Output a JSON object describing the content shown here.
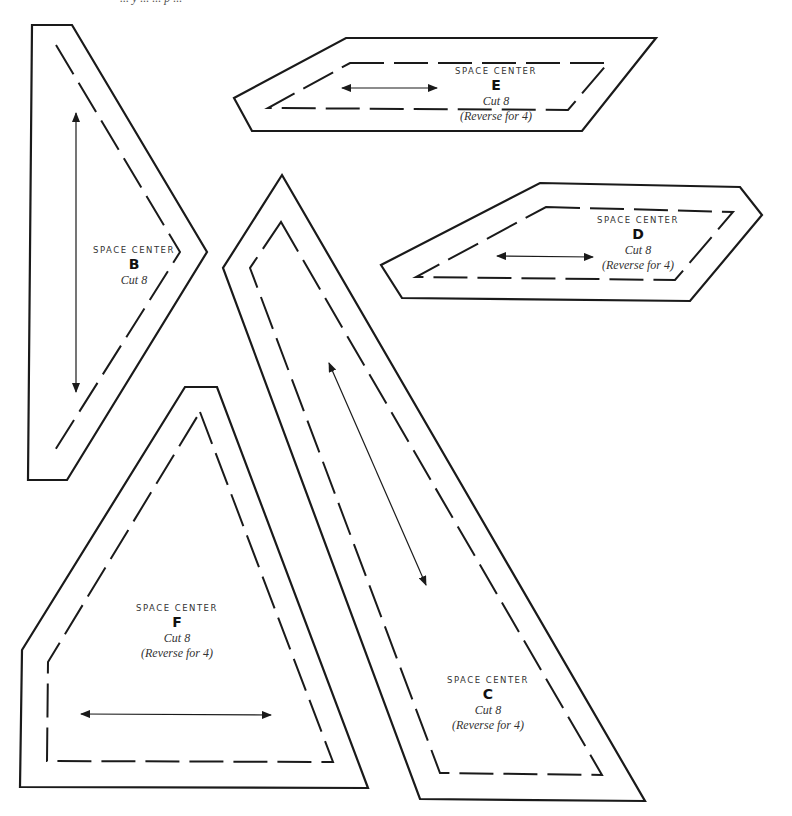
{
  "page": {
    "background": "#ffffff",
    "line_color": "#1a1a1a",
    "top_fragment": "... y ... ... p ..."
  },
  "pieces": {
    "B": {
      "block": "SPACE CENTER",
      "letter": "B",
      "cut": "Cut 8",
      "outline": "32,25 72,25 207,252 67,480 28,480",
      "seam": "56,45 180,252 52,455",
      "seam_closed": false,
      "grain": {
        "x1": 76,
        "y1": 113,
        "x2": 76,
        "y2": 392
      }
    },
    "E": {
      "block": "SPACE CENTER",
      "letter": "E",
      "cut": "Cut 8",
      "reverse": "(Reverse for 4)",
      "outline": "346,38 656,38 582,131 252,131 234,98",
      "seam": "350,63 608,63 568,110 268,108",
      "grain": {
        "x1": 342,
        "y1": 88,
        "x2": 437,
        "y2": 88
      }
    },
    "D": {
      "block": "SPACE CENTER",
      "letter": "D",
      "cut": "Cut 8",
      "reverse": "(Reverse for 4)",
      "outline": "540,183 740,187 762,215 690,301 402,298 381,265",
      "seam": "546,207 733,212 675,280 416,277",
      "grain": {
        "x1": 497,
        "y1": 256,
        "x2": 593,
        "y2": 257
      }
    },
    "C": {
      "block": "SPACE CENTER",
      "letter": "C",
      "cut": "Cut 8",
      "reverse": "(Reverse for 4)",
      "outline": "282,175 420,799 645,801 223,268",
      "outline_order": "282,175 645,801 420,799 223,268",
      "seam": "281,222 602,775 440,773 250,268",
      "grain": {
        "x1": 329,
        "y1": 363,
        "x2": 426,
        "y2": 585
      }
    },
    "F": {
      "block": "SPACE CENTER",
      "letter": "F",
      "cut": "Cut 8",
      "reverse": "(Reverse for 4)",
      "outline": "185,387 217,387 368,788 20,787 22,650",
      "seam": "200,412 333,762 47,761 48,662",
      "grain": {
        "x1": 81,
        "y1": 714,
        "x2": 271,
        "y2": 715
      }
    }
  }
}
